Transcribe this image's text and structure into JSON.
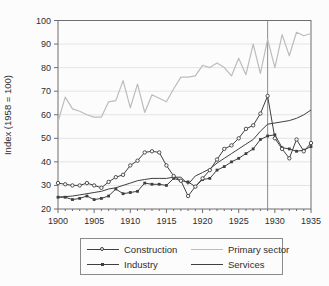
{
  "chart_data": {
    "type": "line",
    "title": "",
    "xlabel": "",
    "ylabel": "Index (1958 = 100)",
    "xlim": [
      1900,
      1935
    ],
    "ylim": [
      20,
      100
    ],
    "x_ticks": [
      1900,
      1905,
      1910,
      1915,
      1920,
      1925,
      1930,
      1935
    ],
    "x_minor_tick_step": 1,
    "y_ticks": [
      20,
      30,
      40,
      50,
      60,
      70,
      80,
      90,
      100
    ],
    "grid": "horizontal light gray lines at each y tick",
    "frame": true,
    "reference_line_x": 1929,
    "legend_position": "below plot, 2x2 boxed",
    "colors": {
      "dark_line": "#3f3f3f",
      "light_line": "#bcbcbc",
      "frame": "#6e6e6e",
      "gridline": "#e4e4e4",
      "reference_line": "#8c8c8c",
      "background": "#fcfcfc"
    },
    "x": [
      1900,
      1901,
      1902,
      1903,
      1904,
      1905,
      1906,
      1907,
      1908,
      1909,
      1910,
      1911,
      1912,
      1913,
      1914,
      1915,
      1916,
      1917,
      1918,
      1919,
      1920,
      1921,
      1922,
      1923,
      1924,
      1925,
      1926,
      1927,
      1928,
      1929,
      1930,
      1931,
      1932,
      1933,
      1934,
      1935
    ],
    "series": [
      {
        "name": "Construction",
        "marker": "open-circle",
        "color": "#3f3f3f",
        "values": [
          31,
          30.5,
          30,
          30,
          31,
          30,
          29,
          31.5,
          33.5,
          34.5,
          38.5,
          40.5,
          44,
          44.5,
          44,
          38.5,
          34,
          32,
          25.5,
          29.5,
          33,
          36.5,
          41,
          45.5,
          47,
          50,
          54,
          55.5,
          60.5,
          68,
          50,
          45.5,
          41.5,
          49.5,
          44.5,
          48
        ]
      },
      {
        "name": "Industry",
        "marker": "filled-square",
        "color": "#3f3f3f",
        "values": [
          25,
          25,
          24,
          24.5,
          25.5,
          24,
          24.5,
          25.5,
          28.5,
          26.5,
          27,
          27.5,
          31,
          30.5,
          30.5,
          30,
          33,
          32,
          31.5,
          29.5,
          32.5,
          33,
          36.5,
          38,
          40,
          41.5,
          43.5,
          45.5,
          49.5,
          51,
          51.5,
          46,
          45.5,
          44.5,
          45,
          46.5
        ]
      },
      {
        "name": "Primary sector",
        "marker": "none",
        "color": "#bcbcbc",
        "values": [
          57,
          67.5,
          62.5,
          61.5,
          60,
          59,
          59,
          65.5,
          66,
          74.5,
          63,
          73,
          61,
          68.5,
          67,
          65.5,
          71,
          76,
          76,
          76.5,
          81,
          80,
          82,
          80,
          76.5,
          84,
          77,
          90,
          77.5,
          92,
          80,
          94,
          85,
          95,
          93.5,
          94.5
        ]
      },
      {
        "name": "Services",
        "marker": "none",
        "color": "#3f3f3f",
        "values": [
          25,
          25.2,
          25.5,
          26,
          26.5,
          27,
          27.5,
          28.5,
          29,
          30,
          31,
          32,
          32.5,
          33,
          33,
          33,
          33.5,
          33.5,
          30.5,
          34,
          35.5,
          37,
          39.5,
          41.5,
          43.5,
          45.5,
          47.5,
          49.5,
          53,
          56,
          56.5,
          57,
          57.5,
          58.5,
          60,
          62
        ]
      }
    ]
  }
}
